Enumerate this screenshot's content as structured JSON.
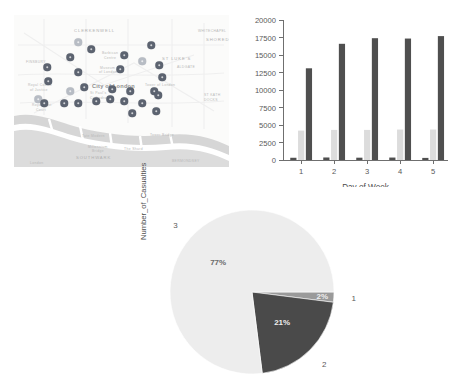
{
  "map": {
    "name": "city-of-london-incident-map",
    "city_label": "City of London",
    "district_labels": [
      {
        "text": "CLERKENWELL",
        "x": 60,
        "y": 13
      },
      {
        "text": "ST LUKE'S",
        "x": 148,
        "y": 41
      },
      {
        "text": "SHOREDITCH",
        "x": 192,
        "y": 22
      },
      {
        "text": "SOUTHWARK",
        "x": 62,
        "y": 140
      }
    ],
    "street_labels": [
      {
        "text": "FINSBURY",
        "x": 12,
        "y": 45
      },
      {
        "text": "Barbican",
        "x": 88,
        "y": 36
      },
      {
        "text": "Centre",
        "x": 90,
        "y": 41
      },
      {
        "text": "Museum",
        "x": 86,
        "y": 51
      },
      {
        "text": "of London",
        "x": 85,
        "y": 55
      },
      {
        "text": "Royal Courts",
        "x": 14,
        "y": 68
      },
      {
        "text": "of Justice",
        "x": 16,
        "y": 73
      },
      {
        "text": "St Paul's",
        "x": 76,
        "y": 76
      },
      {
        "text": "Cathedral",
        "x": 76,
        "y": 81
      },
      {
        "text": "Royal Mint",
        "x": 18,
        "y": 88
      },
      {
        "text": "Court",
        "x": 22,
        "y": 93
      },
      {
        "text": "Tower of London",
        "x": 131,
        "y": 68
      },
      {
        "text": "ALDGATE",
        "x": 163,
        "y": 50
      },
      {
        "text": "WHITECHAPEL",
        "x": 184,
        "y": 44
      },
      {
        "text": "Tower Bridge",
        "x": 136,
        "y": 118
      },
      {
        "text": "Tate Modern",
        "x": 68,
        "y": 119
      },
      {
        "text": "Millennium",
        "x": 74,
        "y": 130
      },
      {
        "text": "Bridge",
        "x": 78,
        "y": 134
      },
      {
        "text": "The Shard",
        "x": 110,
        "y": 132
      },
      {
        "text": "London",
        "x": 16,
        "y": 146
      },
      {
        "text": "BOROUGH",
        "x": 110,
        "y": 147
      },
      {
        "text": "BERMONDSEY",
        "x": 158,
        "y": 144
      },
      {
        "text": "RIVER THAMES",
        "x": 30,
        "y": 106
      }
    ],
    "pins": [
      {
        "x": 64,
        "y": 27,
        "tone": "light"
      },
      {
        "x": 77,
        "y": 34,
        "tone": "dark"
      },
      {
        "x": 56,
        "y": 42,
        "tone": "dark"
      },
      {
        "x": 110,
        "y": 40,
        "tone": "dark"
      },
      {
        "x": 137,
        "y": 30,
        "tone": "dark"
      },
      {
        "x": 128,
        "y": 46,
        "tone": "light"
      },
      {
        "x": 145,
        "y": 50,
        "tone": "dark"
      },
      {
        "x": 33,
        "y": 52,
        "tone": "dark"
      },
      {
        "x": 34,
        "y": 66,
        "tone": "dark"
      },
      {
        "x": 64,
        "y": 57,
        "tone": "dark"
      },
      {
        "x": 106,
        "y": 54,
        "tone": "dark"
      },
      {
        "x": 148,
        "y": 62,
        "tone": "dark"
      },
      {
        "x": 70,
        "y": 72,
        "tone": "dark"
      },
      {
        "x": 56,
        "y": 76,
        "tone": "light"
      },
      {
        "x": 98,
        "y": 74,
        "tone": "dark"
      },
      {
        "x": 116,
        "y": 76,
        "tone": "dark"
      },
      {
        "x": 140,
        "y": 76,
        "tone": "dark"
      },
      {
        "x": 144,
        "y": 80,
        "tone": "dark"
      },
      {
        "x": 24,
        "y": 84,
        "tone": "light"
      },
      {
        "x": 30,
        "y": 88,
        "tone": "dark"
      },
      {
        "x": 50,
        "y": 88,
        "tone": "dark"
      },
      {
        "x": 64,
        "y": 88,
        "tone": "dark"
      },
      {
        "x": 82,
        "y": 86,
        "tone": "dark"
      },
      {
        "x": 96,
        "y": 84,
        "tone": "dark"
      },
      {
        "x": 110,
        "y": 86,
        "tone": "dark"
      },
      {
        "x": 128,
        "y": 88,
        "tone": "dark"
      },
      {
        "x": 118,
        "y": 98,
        "tone": "dark"
      },
      {
        "x": 142,
        "y": 96,
        "tone": "dark"
      }
    ],
    "colors": {
      "pin_dark": "#5c6370",
      "pin_light": "#b7bcc4",
      "land": "#fbfbfa",
      "water": "#d9d9d9",
      "road": "#efefef"
    }
  },
  "chart_data": [
    {
      "id": "bar-chart",
      "type": "bar",
      "title": "",
      "xlabel": "Day of Week",
      "ylabel": "",
      "categories": [
        "1",
        "2",
        "3",
        "4",
        "5"
      ],
      "ytick_labels": [
        "0",
        "2500",
        "5000",
        "7500",
        "10000",
        "12500",
        "15000",
        "17500",
        "20000"
      ],
      "ytick_values": [
        0,
        2500,
        5000,
        7500,
        10000,
        12500,
        15000,
        17500,
        20000
      ],
      "ylim": [
        0,
        20000
      ],
      "grid": false,
      "legend": "none",
      "series": [
        {
          "name": "series-1",
          "color": "#4f4f4f",
          "values": [
            320,
            360,
            330,
            350,
            300
          ]
        },
        {
          "name": "series-2",
          "color": "#dcdcdc",
          "values": [
            4200,
            4300,
            4300,
            4350,
            4350
          ]
        },
        {
          "name": "series-3",
          "color": "#4f4f4f",
          "values": [
            13100,
            16600,
            17400,
            17350,
            17700
          ]
        }
      ]
    },
    {
      "id": "pie-chart",
      "type": "pie",
      "title": "",
      "ylabel": "Number_of_Casualties",
      "labels": [
        "1",
        "2",
        "3"
      ],
      "values": [
        2,
        21,
        77
      ],
      "pct_labels": [
        "2%",
        "21%",
        "77%"
      ],
      "colors": [
        "#9a9a9a",
        "#4a4a4a",
        "#ededed"
      ],
      "legend": "none",
      "start_angle_deg": 0
    }
  ]
}
